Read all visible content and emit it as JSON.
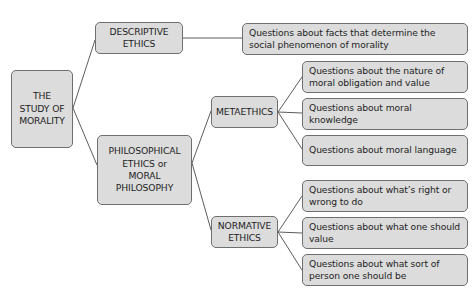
{
  "diagram": {
    "type": "tree",
    "root": {
      "label": "THE STUDY OF MORALITY"
    },
    "branches": [
      {
        "label": "DESCRIPTIVE ETHICS",
        "questions": [
          "Questions about facts that determine the social phenomenon of morality"
        ]
      },
      {
        "label": "PHILOSOPHICAL ETHICS or MORAL PHILOSOPHY",
        "children": [
          {
            "label": "METAETHICS",
            "questions": [
              "Questions about the nature of moral obligation and value",
              "Questions about moral knowledge",
              "Questions about moral language"
            ]
          },
          {
            "label": "NORMATIVE ETHICS",
            "questions": [
              "Questions about what’s right or wrong to do",
              "Questions about what one should value",
              "Questions about what sort of person one should be"
            ]
          }
        ]
      }
    ]
  },
  "colors": {
    "node_fill": "#dcdcdc",
    "node_border": "#6f6f6f",
    "connector": "#4a4a4a",
    "text": "#1e1e1e",
    "background": "#ffffff"
  }
}
